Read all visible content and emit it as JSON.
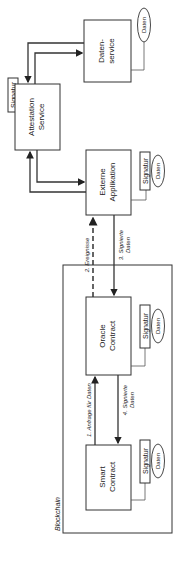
{
  "diagram": {
    "frame_label": "Blockchain",
    "nodes": {
      "datenservice": [
        "Daten-",
        "service"
      ],
      "attestation": [
        "Attestation",
        "Service"
      ],
      "externe": [
        "Externe",
        "Applikation"
      ],
      "oracle": [
        "Oracle",
        "Contract"
      ],
      "smart": [
        "Smart",
        "Contract"
      ]
    },
    "tags": {
      "signatur": "Signatur",
      "daten": "Daten"
    },
    "edges": {
      "e1": "1. Anfrage für Daten",
      "e2": "2. Ereignisse",
      "e3": [
        "3. Signierte",
        "Daten"
      ],
      "e4": [
        "4. Signierte",
        "Daten"
      ]
    }
  }
}
